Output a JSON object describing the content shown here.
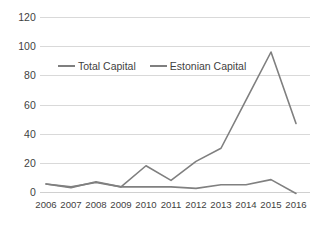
{
  "chart_data": {
    "type": "line",
    "title": "",
    "xlabel": "",
    "ylabel": "",
    "categories": [
      "2006",
      "2007",
      "2008",
      "2009",
      "2010",
      "2011",
      "2012",
      "2013",
      "2014",
      "2015",
      "2016"
    ],
    "ylim": [
      0,
      120
    ],
    "yticks": [
      0,
      20,
      40,
      60,
      80,
      100,
      120
    ],
    "grid": true,
    "legend_position": "top-center-inside",
    "series": [
      {
        "name": "Total Capital",
        "color": "#7f7f7f",
        "values": [
          5.5,
          3.5,
          6.5,
          3.5,
          18.0,
          8.0,
          21.0,
          30.0,
          63.0,
          96.0,
          47.0
        ]
      },
      {
        "name": "Estonian Capital",
        "color": "#808080",
        "values": [
          5.5,
          3.0,
          7.0,
          3.5,
          3.5,
          3.5,
          2.5,
          5.0,
          5.0,
          8.5,
          -1.0
        ]
      }
    ]
  },
  "axis": {
    "ytick_labels": [
      "120",
      "100",
      "80",
      "60",
      "40",
      "20",
      "0"
    ],
    "xtick_labels": [
      "2006",
      "2007",
      "2008",
      "2009",
      "2010",
      "2011",
      "2012",
      "2013",
      "2014",
      "2015",
      "2016"
    ]
  },
  "legend": {
    "items": [
      {
        "label": "Total Capital"
      },
      {
        "label": "Estonian Capital"
      }
    ]
  },
  "colors": {
    "line": "#7f7f7f",
    "grid": "#d9d9d9",
    "text": "#3f3f3f",
    "background": "#ffffff"
  }
}
